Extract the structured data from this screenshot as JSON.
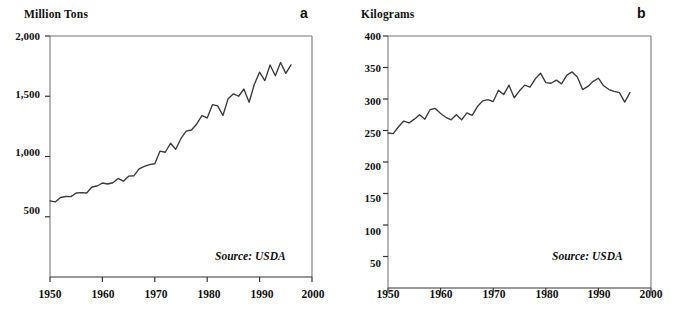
{
  "figure": {
    "background": "#ffffff",
    "line_color": "#3a3a3a",
    "axis_color": "#777777"
  },
  "panels": [
    {
      "id": "a",
      "label": "a",
      "axis_title": "Million Tons",
      "source": "Source: USDA",
      "y_ticks": [
        "500",
        "1,000",
        "1,500",
        "2,000"
      ],
      "x_ticks": [
        "1950",
        "1960",
        "1970",
        "1980",
        "1990",
        "2000"
      ]
    },
    {
      "id": "b",
      "label": "b",
      "axis_title": "Kilograms",
      "source": "Source: USDA",
      "y_ticks": [
        "50",
        "100",
        "150",
        "200",
        "250",
        "300",
        "350",
        "400"
      ],
      "x_ticks": [
        "1950",
        "1960",
        "1970",
        "1980",
        "1990",
        "2000"
      ]
    }
  ],
  "chart_data": [
    {
      "type": "line",
      "panel": "a",
      "title": "Million Tons",
      "subtitle": "",
      "xlabel": "",
      "ylabel": "Million Tons",
      "annotations": [
        "Source: USDA",
        "a"
      ],
      "legend": [],
      "grid": false,
      "xlim": [
        1950,
        2000
      ],
      "ylim": [
        0,
        2000
      ],
      "y_tick_values": [
        500,
        1000,
        1500,
        2000
      ],
      "x_tick_values": [
        1950,
        1960,
        1970,
        1980,
        1990,
        2000
      ],
      "x": [
        1950,
        1951,
        1952,
        1953,
        1954,
        1955,
        1956,
        1957,
        1958,
        1959,
        1960,
        1961,
        1962,
        1963,
        1964,
        1965,
        1966,
        1967,
        1968,
        1969,
        1970,
        1971,
        1972,
        1973,
        1974,
        1975,
        1976,
        1977,
        1978,
        1979,
        1980,
        1981,
        1982,
        1983,
        1984,
        1985,
        1986,
        1987,
        1988,
        1989,
        1990,
        1991,
        1992,
        1993,
        1994,
        1995,
        1996
      ],
      "values": [
        631,
        623,
        660,
        668,
        667,
        697,
        700,
        697,
        747,
        755,
        780,
        772,
        782,
        818,
        795,
        837,
        840,
        898,
        918,
        932,
        940,
        1045,
        1035,
        1110,
        1060,
        1150,
        1210,
        1220,
        1270,
        1340,
        1320,
        1430,
        1420,
        1340,
        1480,
        1520,
        1500,
        1560,
        1450,
        1600,
        1700,
        1630,
        1760,
        1670,
        1780,
        1690,
        1760
      ],
      "series": [
        {
          "name": "World grain production",
          "values": [
            631,
            623,
            660,
            668,
            667,
            697,
            700,
            697,
            747,
            755,
            780,
            772,
            782,
            818,
            795,
            837,
            840,
            898,
            918,
            932,
            940,
            1045,
            1035,
            1110,
            1060,
            1150,
            1210,
            1220,
            1270,
            1340,
            1320,
            1430,
            1420,
            1340,
            1480,
            1520,
            1500,
            1560,
            1450,
            1600,
            1700,
            1630,
            1760,
            1670,
            1780,
            1690,
            1760
          ]
        }
      ]
    },
    {
      "type": "line",
      "panel": "b",
      "title": "Kilograms",
      "subtitle": "",
      "xlabel": "",
      "ylabel": "Kilograms",
      "annotations": [
        "Source: USDA",
        "b"
      ],
      "legend": [],
      "grid": false,
      "xlim": [
        1950,
        2000
      ],
      "ylim": [
        0,
        400
      ],
      "y_tick_values": [
        50,
        100,
        150,
        200,
        250,
        300,
        350,
        400
      ],
      "x_tick_values": [
        1950,
        1960,
        1970,
        1980,
        1990,
        2000
      ],
      "x": [
        1950,
        1951,
        1952,
        1953,
        1954,
        1955,
        1956,
        1957,
        1958,
        1959,
        1960,
        1961,
        1962,
        1963,
        1964,
        1965,
        1966,
        1967,
        1968,
        1969,
        1970,
        1971,
        1972,
        1973,
        1974,
        1975,
        1976,
        1977,
        1978,
        1979,
        1980,
        1981,
        1982,
        1983,
        1984,
        1985,
        1986,
        1987,
        1988,
        1989,
        1990,
        1991,
        1992,
        1993,
        1994,
        1995,
        1996
      ],
      "values": [
        246,
        245,
        256,
        265,
        262,
        268,
        275,
        268,
        283,
        285,
        277,
        271,
        267,
        275,
        267,
        278,
        274,
        288,
        297,
        299,
        296,
        314,
        307,
        322,
        302,
        313,
        322,
        319,
        332,
        341,
        326,
        325,
        330,
        324,
        338,
        343,
        335,
        315,
        320,
        328,
        333,
        321,
        315,
        312,
        310,
        295,
        310
      ],
      "series": [
        {
          "name": "World grain production per person",
          "values": [
            246,
            245,
            256,
            265,
            262,
            268,
            275,
            268,
            283,
            285,
            277,
            271,
            267,
            275,
            267,
            278,
            274,
            288,
            297,
            299,
            296,
            314,
            307,
            322,
            302,
            313,
            322,
            319,
            332,
            341,
            326,
            325,
            330,
            324,
            338,
            343,
            335,
            315,
            320,
            328,
            333,
            321,
            315,
            312,
            310,
            295,
            310
          ]
        }
      ]
    }
  ]
}
